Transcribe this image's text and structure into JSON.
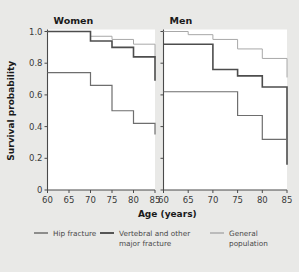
{
  "figure": {
    "background_color": "#e9e9e7",
    "plot_background_color": "#ffffff",
    "axis_color": "#4a4a4a"
  },
  "axes": {
    "ylabel": "Survival probability",
    "xlabel": "Age (years)",
    "y_ticks": [
      "1.0",
      "0.8",
      "0.6",
      "0.4",
      "0.2",
      "0"
    ],
    "y_tick_values": [
      1.0,
      0.8,
      0.6,
      0.4,
      0.2,
      0.0
    ],
    "x_ticks": [
      "60",
      "65",
      "70",
      "75",
      "80",
      "85"
    ],
    "x_tick_values": [
      60,
      65,
      70,
      75,
      80,
      85
    ],
    "ylim": [
      0,
      1.0
    ],
    "xlim": [
      60,
      85
    ]
  },
  "panels": [
    {
      "title": "Women"
    },
    {
      "title": "Men"
    }
  ],
  "legend": {
    "position": "bottom",
    "items": [
      {
        "label": "Hip fracture",
        "color": "#6e6e6e",
        "width": 1.1
      },
      {
        "label": "Vertebral and other\nmajor fracture",
        "line1": "Vertebral and other",
        "line2": "major fracture",
        "color": "#4d4d4d",
        "width": 1.5
      },
      {
        "label": "General\npopulation",
        "line1": "General",
        "line2": "population",
        "color": "#a8a8a8",
        "width": 1.0
      }
    ]
  },
  "chart_data": {
    "type": "line",
    "subtype": "step-survival-curves",
    "title": "",
    "xlabel": "Age (years)",
    "ylabel": "Survival probability",
    "xlim": [
      60,
      85
    ],
    "ylim": [
      0,
      1.0
    ],
    "x": [
      60,
      65,
      70,
      75,
      80,
      85
    ],
    "grid": false,
    "legend_position": "bottom",
    "panels": [
      {
        "name": "Women",
        "series": [
          {
            "name": "General population",
            "color": "#a8a8a8",
            "x": [
              60,
              65,
              70,
              75,
              80,
              85
            ],
            "values": [
              1.0,
              1.0,
              0.97,
              0.95,
              0.92,
              0.83
            ]
          },
          {
            "name": "Vertebral and other major fracture",
            "color": "#4d4d4d",
            "x": [
              60,
              65,
              70,
              75,
              80,
              85
            ],
            "values": [
              1.0,
              1.0,
              0.94,
              0.9,
              0.84,
              0.69
            ]
          },
          {
            "name": "Hip fracture",
            "color": "#6e6e6e",
            "x": [
              60,
              65,
              70,
              75,
              80,
              85
            ],
            "values": [
              0.74,
              0.74,
              0.66,
              0.5,
              0.42,
              0.35
            ]
          }
        ]
      },
      {
        "name": "Men",
        "series": [
          {
            "name": "General population",
            "color": "#a8a8a8",
            "x": [
              60,
              65,
              70,
              75,
              80,
              85
            ],
            "values": [
              1.0,
              0.98,
              0.95,
              0.89,
              0.83,
              0.71
            ]
          },
          {
            "name": "Vertebral and other major fracture",
            "color": "#4d4d4d",
            "x": [
              60,
              65,
              70,
              75,
              80,
              85
            ],
            "values": [
              0.92,
              0.92,
              0.76,
              0.72,
              0.65,
              0.16
            ]
          },
          {
            "name": "Hip fracture",
            "color": "#6e6e6e",
            "x": [
              60,
              65,
              70,
              75,
              80,
              85
            ],
            "values": [
              0.62,
              0.62,
              0.62,
              0.47,
              0.32,
              0.32
            ]
          }
        ]
      }
    ]
  }
}
